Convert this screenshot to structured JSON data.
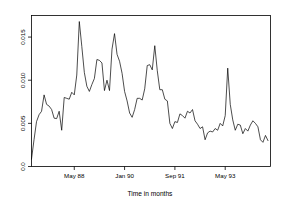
{
  "chart_data": {
    "type": "line",
    "title": "",
    "subtitle": "",
    "xlabel": "Time in months",
    "ylabel": "",
    "grid": false,
    "legend": null,
    "line_color": "#000000",
    "background_color": "#ffffff",
    "frame_color": "#000000",
    "xlim": [
      0,
      95
    ],
    "ylim": [
      0.0,
      0.0175
    ],
    "yticks": [
      0.0,
      0.005,
      0.01,
      0.015
    ],
    "ytick_labels": [
      "0.0",
      "0.005",
      "0.010",
      "0.015"
    ],
    "ytick_label_rotation": -90,
    "xticks": [
      17,
      37,
      57,
      77
    ],
    "xtick_labels": [
      "May 88",
      "Jan 90",
      "Sep 91",
      "May 93"
    ],
    "x_index_unit": "months",
    "x": [
      0,
      1,
      2,
      3,
      4,
      5,
      6,
      7,
      8,
      9,
      10,
      11,
      12,
      13,
      14,
      15,
      16,
      17,
      18,
      19,
      20,
      21,
      22,
      23,
      24,
      25,
      26,
      27,
      28,
      29,
      30,
      31,
      32,
      33,
      34,
      35,
      36,
      37,
      38,
      39,
      40,
      41,
      42,
      43,
      44,
      45,
      46,
      47,
      48,
      49,
      50,
      51,
      52,
      53,
      54,
      55,
      56,
      57,
      58,
      59,
      60,
      61,
      62,
      63,
      64,
      65,
      66,
      67,
      68,
      69,
      70,
      71,
      72,
      73,
      74,
      75,
      76,
      77,
      78,
      79,
      80,
      81,
      82,
      83,
      84,
      85,
      86,
      87,
      88,
      89,
      90,
      91,
      92,
      93,
      94
    ],
    "values": [
      0.00085,
      0.0031,
      0.0052,
      0.006,
      0.0064,
      0.0083,
      0.0072,
      0.007,
      0.0066,
      0.0056,
      0.00555,
      0.0064,
      0.0042,
      0.008,
      0.0079,
      0.0078,
      0.0086,
      0.0083,
      0.0106,
      0.0168,
      0.0139,
      0.0109,
      0.0093,
      0.0087,
      0.0095,
      0.0102,
      0.0124,
      0.0123,
      0.012,
      0.0088,
      0.01,
      0.0088,
      0.0136,
      0.0154,
      0.013,
      0.0122,
      0.0108,
      0.0087,
      0.0076,
      0.0062,
      0.0057,
      0.0066,
      0.0079,
      0.0079,
      0.0077,
      0.009,
      0.0117,
      0.0118,
      0.0112,
      0.014,
      0.0111,
      0.0089,
      0.0089,
      0.0078,
      0.0076,
      0.005,
      0.0044,
      0.0052,
      0.0051,
      0.0061,
      0.0059,
      0.0056,
      0.0064,
      0.0062,
      0.0066,
      0.0053,
      0.0049,
      0.0044,
      0.0046,
      0.0031,
      0.0039,
      0.0041,
      0.004,
      0.0044,
      0.0042,
      0.005,
      0.0047,
      0.0059,
      0.0114,
      0.0072,
      0.0054,
      0.0042,
      0.0049,
      0.0048,
      0.0038,
      0.0044,
      0.0041,
      0.0048,
      0.0053,
      0.005,
      0.0046,
      0.0031,
      0.0028,
      0.0036,
      0.003
    ]
  }
}
